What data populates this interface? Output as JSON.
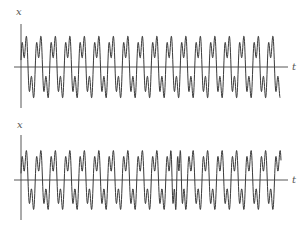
{
  "chart_data": [
    {
      "type": "line",
      "title": "",
      "xlabel": "t",
      "ylabel": "x",
      "grid": false,
      "legend": null,
      "description": "Periodic oscillation, each period has a tall and a short positive peak and two negative troughs; ~18 periods",
      "periods": 18,
      "series": [
        {
          "name": "x(t) regular",
          "formula": "sin(theta) + 0.6*sin(3*theta + 0.5)",
          "phase_jump": null
        }
      ],
      "pixel_layout": {
        "x0": 21,
        "x_end": 280,
        "axis_y": 67,
        "axis_x_start": 14,
        "axis_x_end": 288,
        "y_axis_top": 24,
        "y_axis_bottom": 108,
        "amplitude_px": 24,
        "period_px": 14.5,
        "start_phase": 0.0
      }
    },
    {
      "type": "line",
      "title": "",
      "xlabel": "t",
      "ylabel": "x",
      "grid": false,
      "legend": null,
      "description": "Same oscillation with a phase slip / disturbance near the middle of the record",
      "periods": 18,
      "series": [
        {
          "name": "x(t) with phase slip",
          "formula": "sin(theta) + 0.6*sin(3*theta + 0.5)",
          "phase_jump": {
            "at_px": 168,
            "width_px": 18,
            "shift_rad": 3.14
          }
        }
      ],
      "pixel_layout": {
        "x0": 21,
        "x_end": 281,
        "axis_y": 180,
        "axis_x_start": 14,
        "axis_x_end": 288,
        "y_axis_top": 135,
        "y_axis_bottom": 220,
        "amplitude_px": 23,
        "period_px": 14.5,
        "start_phase": 0.0
      }
    }
  ],
  "labels": {
    "top_y": "x",
    "top_x": "t",
    "bottom_y": "x",
    "bottom_x": "t"
  },
  "colors": {
    "axis": "#444444",
    "curve": "#3a3a3a"
  }
}
